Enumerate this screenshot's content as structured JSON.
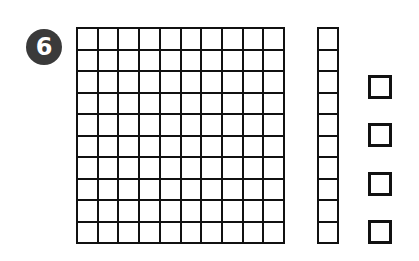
{
  "problem": {
    "number": "6",
    "badge_color": "#3a3a3a"
  },
  "base_ten_blocks": {
    "hundreds_flats": 1,
    "tens_rods": 1,
    "ones_units": 4,
    "grid_rows": 10,
    "grid_cols": 10,
    "rod_cells": 10
  }
}
